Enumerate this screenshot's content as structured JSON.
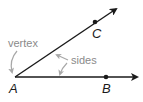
{
  "diagram": {
    "type": "angle",
    "vertex": {
      "label": "A",
      "x": 15,
      "y": 77
    },
    "points": [
      {
        "label": "C",
        "x": 95,
        "y": 22,
        "ray": "AC"
      },
      {
        "label": "B",
        "x": 106,
        "y": 77,
        "ray": "AB"
      }
    ],
    "annotations": {
      "vertex_label": "vertex",
      "sides_label": "sides"
    },
    "colors": {
      "ray": "#1a1a1a",
      "annotation": "#8a8a8a",
      "annotation_arrow": "#a8a8a8"
    }
  }
}
